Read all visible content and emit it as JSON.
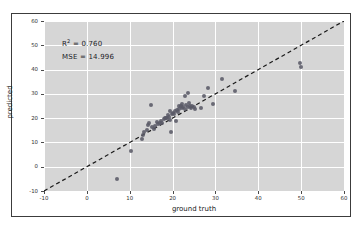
{
  "chart_data": {
    "type": "scatter",
    "title": "",
    "xlabel": "ground truth",
    "ylabel": "predicted",
    "xlim": [
      -10,
      60
    ],
    "ylim": [
      -10,
      60
    ],
    "xticks": [
      -10,
      0,
      10,
      20,
      30,
      40,
      50,
      60
    ],
    "yticks": [
      -10,
      0,
      10,
      20,
      30,
      40,
      50,
      60
    ],
    "xticklabels": [
      "-10",
      "0",
      "10",
      "20",
      "30",
      "40",
      "50",
      "60"
    ],
    "yticklabels": [
      "-10",
      "0",
      "10",
      "20",
      "30",
      "40",
      "50",
      "60"
    ],
    "grid": true,
    "legend": null,
    "background": "#d6d6d6",
    "gridline_color": "#ffffff",
    "marker_color": "#5a5a66",
    "reference_line": {
      "style": "dashed",
      "color": "#1a1a1a",
      "from": [
        -10,
        -10
      ],
      "to": [
        60,
        60
      ],
      "label": "y = x identity line"
    },
    "annotations": [
      {
        "name": "r-squared",
        "text": "R² = 0.760",
        "prefix": "R",
        "superscript": "2",
        "suffix": " = 0.760",
        "value": 0.76
      },
      {
        "name": "mse",
        "text": "MSE = 14.996",
        "prefix": "MSE = ",
        "suffix": "14.996",
        "value": 14.996
      }
    ],
    "points": [
      [
        7.0,
        -5.2
      ],
      [
        10.2,
        6.3
      ],
      [
        12.9,
        11.6
      ],
      [
        13.1,
        13.2
      ],
      [
        13.4,
        14.1
      ],
      [
        14.0,
        15.0
      ],
      [
        14.3,
        17.2
      ],
      [
        14.6,
        17.9
      ],
      [
        15.0,
        25.3
      ],
      [
        15.2,
        16.3
      ],
      [
        15.6,
        15.7
      ],
      [
        16.0,
        16.9
      ],
      [
        16.4,
        18.6
      ],
      [
        16.7,
        17.6
      ],
      [
        17.0,
        18.2
      ],
      [
        17.3,
        19.0
      ],
      [
        17.6,
        18.0
      ],
      [
        17.9,
        19.6
      ],
      [
        18.2,
        19.9
      ],
      [
        18.4,
        20.2
      ],
      [
        18.6,
        20.0
      ],
      [
        18.9,
        21.1
      ],
      [
        19.1,
        20.6
      ],
      [
        19.3,
        22.8
      ],
      [
        19.5,
        19.3
      ],
      [
        19.7,
        14.1
      ],
      [
        19.9,
        21.6
      ],
      [
        20.1,
        22.2
      ],
      [
        20.3,
        21.9
      ],
      [
        20.5,
        23.0
      ],
      [
        20.7,
        18.7
      ],
      [
        21.0,
        23.4
      ],
      [
        21.2,
        22.6
      ],
      [
        21.4,
        24.9
      ],
      [
        21.6,
        23.7
      ],
      [
        21.9,
        25.0
      ],
      [
        22.1,
        24.2
      ],
      [
        22.3,
        26.0
      ],
      [
        22.5,
        24.6
      ],
      [
        22.8,
        23.9
      ],
      [
        23.0,
        29.1
      ],
      [
        23.2,
        25.5
      ],
      [
        23.5,
        24.4
      ],
      [
        23.7,
        30.2
      ],
      [
        23.9,
        26.3
      ],
      [
        24.1,
        24.8
      ],
      [
        24.3,
        24.1
      ],
      [
        24.6,
        25.2
      ],
      [
        24.9,
        24.5
      ],
      [
        25.2,
        23.8
      ],
      [
        26.6,
        24.2
      ],
      [
        27.4,
        29.0
      ],
      [
        28.2,
        32.6
      ],
      [
        29.4,
        25.9
      ],
      [
        31.6,
        36.1
      ],
      [
        34.6,
        31.1
      ],
      [
        49.8,
        42.6
      ],
      [
        49.9,
        40.9
      ]
    ]
  }
}
